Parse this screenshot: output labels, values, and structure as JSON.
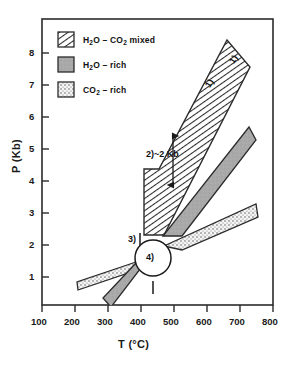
{
  "chart_data": {
    "type": "area",
    "title": "",
    "xlabel": "T (°C)",
    "ylabel": "P (Kb)",
    "xlim": [
      100,
      800
    ],
    "ylim": [
      0,
      8.8
    ],
    "grid": false,
    "x_ticks": [
      100,
      200,
      300,
      400,
      500,
      600,
      700,
      800
    ],
    "y_ticks": [
      1,
      2,
      3,
      4,
      5,
      6,
      7,
      8
    ],
    "x_tick_labels": [
      "100",
      "200",
      "300",
      "400",
      "500",
      "600",
      "700",
      "800"
    ],
    "y_tick_labels": [
      "1",
      "2",
      "3",
      "4",
      "5",
      "6",
      "7",
      "8"
    ],
    "legend_position": "upper-left",
    "legend": [
      {
        "key": "mixed",
        "label_html": "H<sub>2</sub>O – CO<sub>2</sub> mixed",
        "label": "H2O - CO2 mixed",
        "pattern": "diagonal-hatch",
        "color": "#ffffff"
      },
      {
        "key": "h2o_rich",
        "label_html": "H<sub>2</sub>O – rich",
        "label": "H2O - rich",
        "pattern": "solid-gray",
        "color": "#a8a8a8"
      },
      {
        "key": "co2_rich",
        "label_html": "CO<sub>2</sub> – rich",
        "label": "CO2 - rich",
        "pattern": "stipple-dots",
        "color": "#f2f2f2"
      }
    ],
    "series": [
      {
        "name": "H2O - CO2 mixed band (upper)",
        "pattern": "diagonal-hatch",
        "polygon_TP": [
          [
            410,
            4.3
          ],
          [
            410,
            2.35
          ],
          [
            470,
            2.35
          ],
          [
            735,
            7.6
          ],
          [
            665,
            8.45
          ],
          [
            455,
            4.3
          ]
        ]
      },
      {
        "name": "H2O - rich band (upper)",
        "pattern": "solid-gray",
        "polygon_TP": [
          [
            463,
            2.15
          ],
          [
            520,
            2.15
          ],
          [
            750,
            5.15
          ],
          [
            728,
            5.55
          ]
        ]
      },
      {
        "name": "CO2 - rich band (upper)",
        "pattern": "stipple-dots",
        "polygon_TP": [
          [
            470,
            1.85
          ],
          [
            525,
            1.72
          ],
          [
            755,
            2.75
          ],
          [
            748,
            3.15
          ]
        ]
      },
      {
        "name": "CO2 - rich band (lower left)",
        "pattern": "stipple-dots",
        "polygon_TP": [
          [
            205,
            0.98
          ],
          [
            208,
            0.72
          ],
          [
            398,
            1.35
          ],
          [
            395,
            1.62
          ]
        ]
      },
      {
        "name": "H2O - rich band (lower left)",
        "pattern": "solid-gray",
        "polygon_TP": [
          [
            283,
            0.48
          ],
          [
            307,
            0.22
          ],
          [
            408,
            1.55
          ],
          [
            385,
            1.58
          ]
        ]
      }
    ],
    "annotations": [
      {
        "id": "ann1a",
        "text": "1)",
        "T": 620,
        "P": 7.0,
        "rotation": -58
      },
      {
        "id": "ann1b",
        "text": "1)",
        "T": 692,
        "P": 7.65,
        "rotation": -58
      },
      {
        "id": "ann2",
        "text": "2)~2 Kb",
        "T": 440,
        "P": 4.95,
        "rotation": 0,
        "arrow": {
          "T": 505,
          "P_from": 5.6,
          "P_to": 4.1,
          "double_headed": true
        }
      },
      {
        "id": "ann3",
        "text": "3)",
        "T": 398,
        "P": 2.68,
        "rotation": 0,
        "tick": true
      },
      {
        "id": "ann4",
        "text": "4)",
        "T": 437,
        "P": 1.88,
        "circled": true,
        "circle_radius_px": 22
      }
    ]
  }
}
